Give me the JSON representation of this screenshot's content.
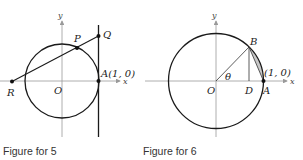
{
  "figures": [
    {
      "caption": "Figure for 5",
      "axis_labels": {
        "x": "x",
        "y": "y"
      },
      "points": {
        "O": "O",
        "P": "P",
        "Q": "Q",
        "R": "R",
        "A": "A(1, 0)"
      }
    },
    {
      "caption": "Figure for 6",
      "axis_labels": {
        "x": "x",
        "y": "y"
      },
      "points": {
        "O": "O",
        "B": "B",
        "D": "D",
        "A": "A",
        "A_coord": "(1, 0)"
      },
      "angle_label": "θ"
    }
  ],
  "colors": {
    "stroke": "#1a1a1a",
    "axis": "#9a9a9a",
    "shade": "#c8c8c8"
  }
}
